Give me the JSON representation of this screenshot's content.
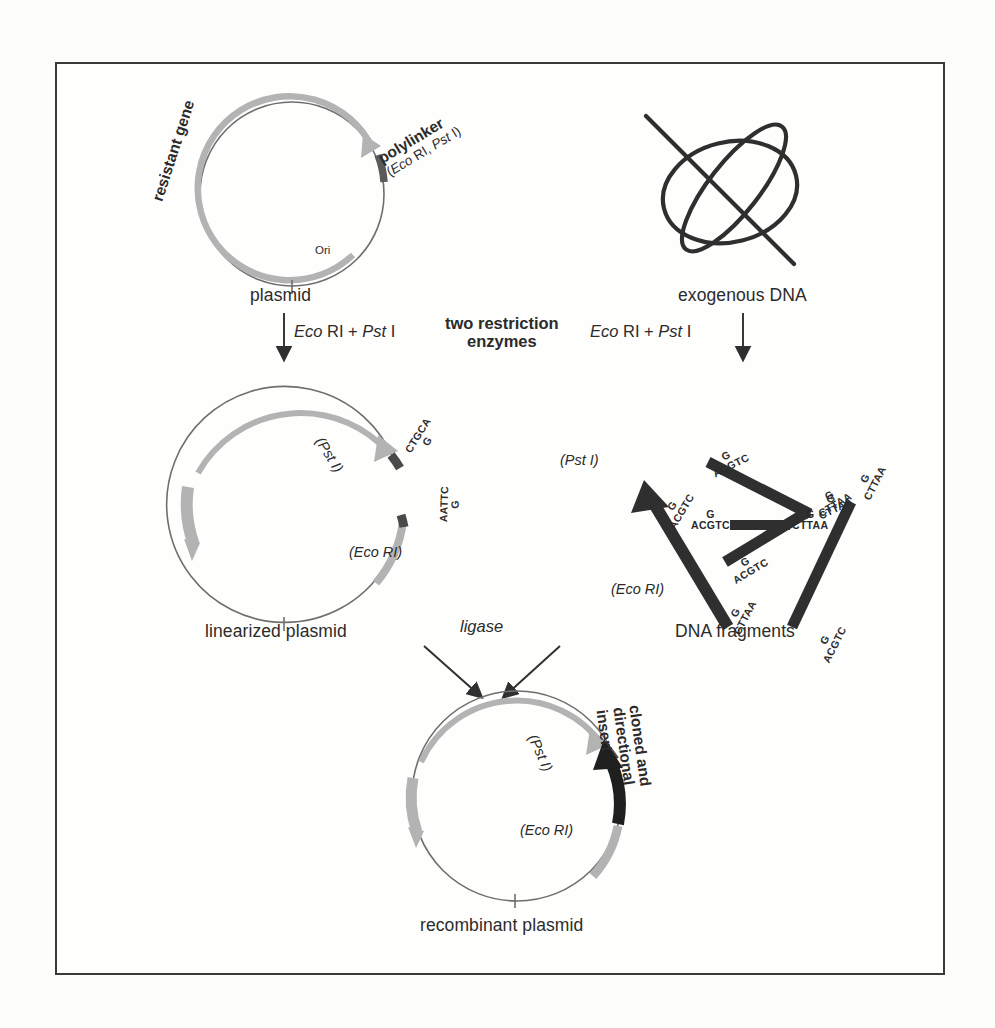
{
  "figure": {
    "title_hidden": "",
    "background_color": "#fefefd",
    "border_color": "#3a3a3a",
    "plasmid_stroke": "#6e6e6e",
    "gene_arc_color": "#b3b3b3",
    "polylinker_color": "#5a5a5a",
    "fragment_color": "#2f2f2f",
    "insert_color": "#1f1f1f"
  },
  "step1": {
    "plasmid_caption": "plasmid",
    "resistant_gene_label": "resistant gene",
    "ori_label": "Ori",
    "polylinker_label": "polylinker",
    "polylinker_sites": "(Eco RI, Pst I)",
    "polylinker_sites_italic_1": "Eco",
    "polylinker_sites_italic_2": "Pst",
    "exogenous_caption": "exogenous DNA"
  },
  "step2": {
    "enzymes_left": {
      "italic_1": "Eco",
      "plain_1": " RI + ",
      "italic_2": "Pst",
      "plain_2": " I"
    },
    "enzymes_right": {
      "italic_1": "Eco",
      "plain_1": " RI  +  ",
      "italic_2": "Pst",
      "plain_2": " I"
    },
    "center_label_line1": "two restriction",
    "center_label_line2": "enzymes"
  },
  "step3": {
    "linearized_caption": "linearized plasmid",
    "fragments_caption": "DNA fragments",
    "pst_site_label": "(Pst I)",
    "pst_site_italic": "Pst",
    "pst_site_plain": " I)",
    "eco_site_label": "(Eco RI)",
    "eco_site_italic": "Eco",
    "eco_site_plain": " RI)",
    "pst_sticky_top": "CTGCA",
    "pst_sticky_bottom": "G",
    "eco_sticky_top": "AATTC",
    "eco_sticky_bottom": "G",
    "ori_label": "Ori"
  },
  "fragments": {
    "pst_end_top": "G",
    "pst_end_bottom": "ACGTC",
    "eco_end_top": "G",
    "eco_end_bottom": "CTTAA",
    "site_pst": {
      "italic": "Pst",
      "plain": " I)"
    },
    "site_eco": {
      "italic": "Eco",
      "plain": " RI)"
    },
    "items": [
      {
        "id": "fragment-1",
        "kind": "bar",
        "angle": -27,
        "length": 118
      },
      {
        "id": "fragment-2",
        "kind": "bar",
        "angle": 0,
        "length": 62
      },
      {
        "id": "fragment-3",
        "kind": "bar",
        "angle": -31,
        "length": 96
      },
      {
        "id": "fragment-4",
        "kind": "bar",
        "angle": -63,
        "length": 150
      },
      {
        "id": "fragment-5",
        "kind": "arrow",
        "angle": -105,
        "length": 200
      }
    ]
  },
  "step4": {
    "ligase_label": "ligase",
    "recombinant_caption": "recombinant plasmid",
    "insert_label_line1": "cloned and",
    "insert_label_line2": "directional",
    "insert_label_line3": "insert",
    "pst_site": {
      "italic": "Pst",
      "plain": " I)"
    },
    "eco_site": {
      "italic": "Eco",
      "plain": " RI)"
    }
  }
}
